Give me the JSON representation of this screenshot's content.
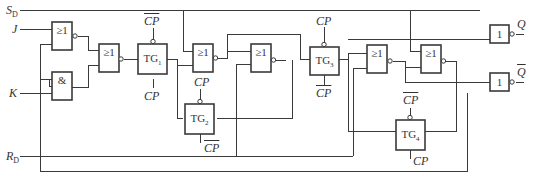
{
  "diagram": {
    "title": "",
    "colors": {
      "line": "#3a3a3a",
      "background": "#ffffff",
      "text": "#333333"
    },
    "inputs": [
      {
        "id": "SD",
        "label": "S",
        "sub": "D"
      },
      {
        "id": "J",
        "label": "J"
      },
      {
        "id": "K",
        "label": "K"
      },
      {
        "id": "RD",
        "label": "R",
        "sub": "D"
      }
    ],
    "outputs": [
      {
        "id": "Q",
        "label": "Q",
        "overline": false
      },
      {
        "id": "Qbar",
        "label": "Q",
        "overline": true
      }
    ],
    "gates": [
      {
        "id": "nor1",
        "type": "NOR",
        "symbol": "≥1"
      },
      {
        "id": "and1",
        "type": "AND",
        "symbol": "&"
      },
      {
        "id": "nor2",
        "type": "NOR",
        "symbol": "≥1"
      },
      {
        "id": "tg1",
        "type": "TG",
        "label": "TG",
        "sub": "1",
        "top_clock": "CP",
        "top_clock_bar": true,
        "bottom_clock": "CP",
        "bottom_clock_bar": false
      },
      {
        "id": "nor3",
        "type": "NOR",
        "symbol": "≥1",
        "clock_label": "CP"
      },
      {
        "id": "tg2",
        "type": "TG",
        "label": "TG",
        "sub": "2",
        "bottom_clock": "CP",
        "bottom_clock_bar": true
      },
      {
        "id": "nor4",
        "type": "NOR",
        "symbol": "≥1"
      },
      {
        "id": "tg3",
        "type": "TG",
        "label": "TG",
        "sub": "3",
        "top_clock": "CP",
        "top_clock_bar": false,
        "bottom_clock": "CP",
        "bottom_clock_bar": true
      },
      {
        "id": "nor5",
        "type": "NOR",
        "symbol": "≥1"
      },
      {
        "id": "nor6",
        "type": "NOR",
        "symbol": "≥1"
      },
      {
        "id": "tg4",
        "type": "TG",
        "label": "TG",
        "sub": "4",
        "top_clock": "CP",
        "top_clock_bar": true,
        "bottom_clock": "CP",
        "bottom_clock_bar": false
      },
      {
        "id": "not1",
        "type": "NOT",
        "symbol": "1"
      },
      {
        "id": "not2",
        "type": "NOT",
        "symbol": "1"
      }
    ],
    "clock_label": "CP"
  }
}
